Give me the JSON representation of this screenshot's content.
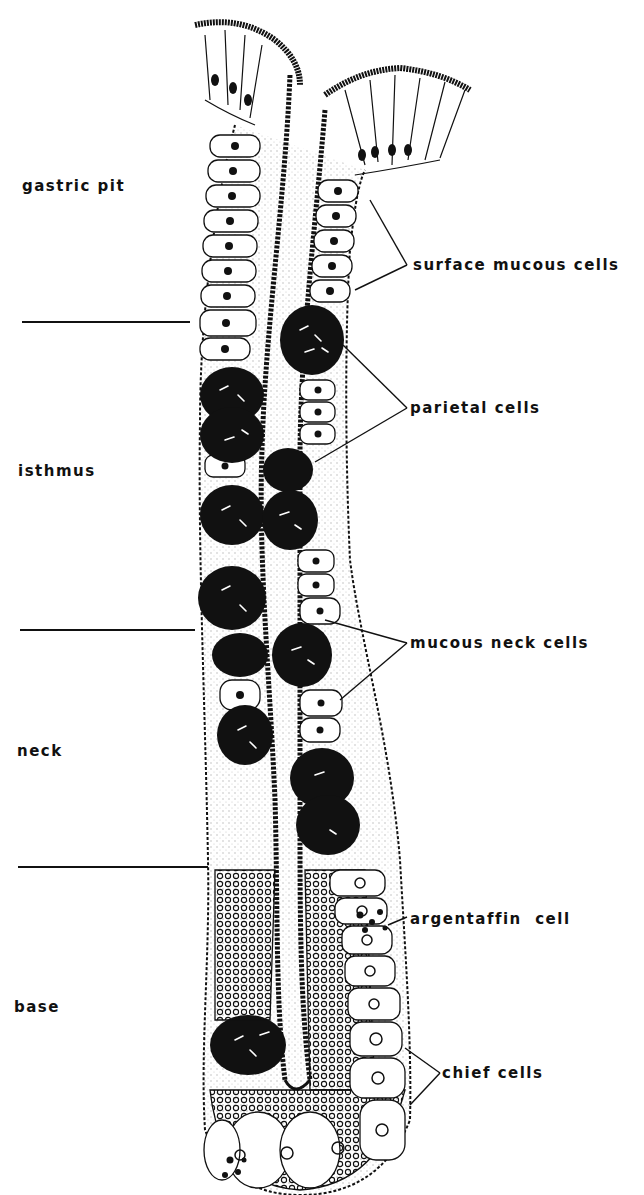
{
  "figure": {
    "regions": [
      {
        "id": "gastric-pit",
        "label": "gastric pit"
      },
      {
        "id": "isthmus",
        "label": "isthmus"
      },
      {
        "id": "neck",
        "label": "neck"
      },
      {
        "id": "base",
        "label": "base"
      }
    ],
    "cell_labels": [
      {
        "id": "surface-mucous-cells",
        "label": "surface mucous cells"
      },
      {
        "id": "parietal-cells",
        "label": "parietal cells"
      },
      {
        "id": "mucous-neck-cells",
        "label": "mucous neck cells"
      },
      {
        "id": "argentaffin-cell",
        "label": "argentaffin  cell"
      },
      {
        "id": "chief-cells",
        "label": "chief cells"
      }
    ],
    "colors": {
      "ink": "#111111",
      "background": "#ffffff"
    }
  }
}
